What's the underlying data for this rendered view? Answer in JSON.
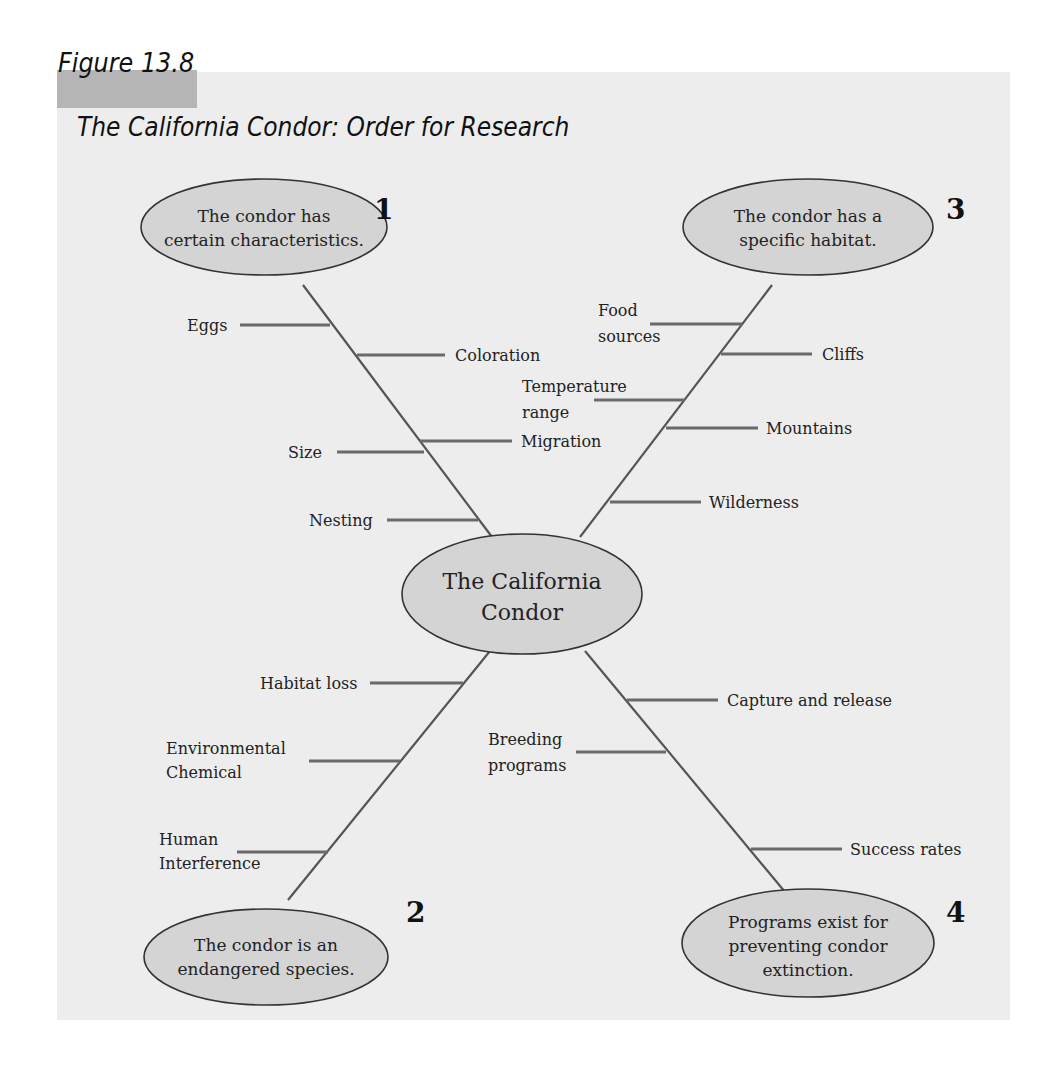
{
  "figure": {
    "label": "Figure 13.8",
    "title": "The California Condor: Order for Research"
  },
  "colors": {
    "panel": "#ededed",
    "label_band": "#b5b5b5",
    "ellipse_fill": "#d4d4d4",
    "line": "#555555"
  },
  "center": {
    "lines": [
      "The California",
      "Condor"
    ]
  },
  "nodes": [
    {
      "number": "1",
      "lines": [
        "The condor has",
        "certain characteristics."
      ],
      "branches": [
        "Eggs",
        "Coloration",
        "Size",
        "Migration",
        "Nesting"
      ]
    },
    {
      "number": "2",
      "lines": [
        "The condor is an",
        "endangered species."
      ],
      "branches": [
        "Habitat loss",
        "Environmental Chemical",
        "Human Interference"
      ]
    },
    {
      "number": "3",
      "lines": [
        "The condor has a",
        "specific habitat."
      ],
      "branches": [
        "Food sources",
        "Cliffs",
        "Temperature range",
        "Mountains",
        "Wilderness"
      ]
    },
    {
      "number": "4",
      "lines": [
        "Programs exist for",
        "preventing condor",
        "extinction."
      ],
      "branches": [
        "Capture and release",
        "Breeding programs",
        "Success rates"
      ]
    }
  ],
  "branch_text": {
    "eggs": "Eggs",
    "coloration": "Coloration",
    "size": "Size",
    "migration": "Migration",
    "nesting": "Nesting",
    "food_1": "Food",
    "food_2": "sources",
    "cliffs": "Cliffs",
    "temp_1": "Temperature",
    "temp_2": "range",
    "mountains": "Mountains",
    "wilderness": "Wilderness",
    "habitat_loss": "Habitat loss",
    "env_1": "Environmental",
    "env_2": "Chemical",
    "human_1": "Human",
    "human_2": "Interference",
    "capture": "Capture and release",
    "breeding_1": "Breeding",
    "breeding_2": "programs",
    "success": "Success rates"
  }
}
